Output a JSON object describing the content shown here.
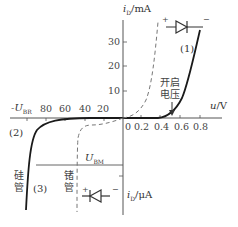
{
  "diagram": {
    "y_axis_top_label": "i_D/mA",
    "y_axis_top_var": "i",
    "y_axis_top_sub": "D",
    "y_axis_top_unit": "/mA",
    "y_axis_bottom_var": "i",
    "y_axis_bottom_sub": "D",
    "y_axis_bottom_unit": "/μA",
    "x_axis_var": "u",
    "x_axis_unit": "/V",
    "y_ticks": [
      "30",
      "20",
      "10"
    ],
    "x_ticks_positive": [
      "0",
      "0.2",
      "0.4",
      "0.6",
      "0.8"
    ],
    "x_ticks_negative": [
      "80",
      "60",
      "40",
      "20"
    ],
    "neg_axis_label_var": "-U",
    "neg_axis_label_sub": "BR",
    "ubm_label_var": "U",
    "ubm_label_sub": "BM",
    "region_1": "(1)",
    "region_2": "(2)",
    "region_3": "(3)",
    "turn_on_voltage_line1": "开启",
    "turn_on_voltage_line2": "电压",
    "silicon_label": "硅\n管",
    "silicon_char1": "硅",
    "silicon_char2": "管",
    "germanium_char1": "锗",
    "germanium_char2": "管",
    "forward_diode_plus": "+",
    "forward_diode_minus": "−",
    "reverse_diode_plus": "+",
    "reverse_diode_minus": "−"
  },
  "colors": {
    "axis": "#555555",
    "silicon_curve": "#1a1a1a",
    "germanium_curve": "#777777",
    "text": "#333333"
  }
}
